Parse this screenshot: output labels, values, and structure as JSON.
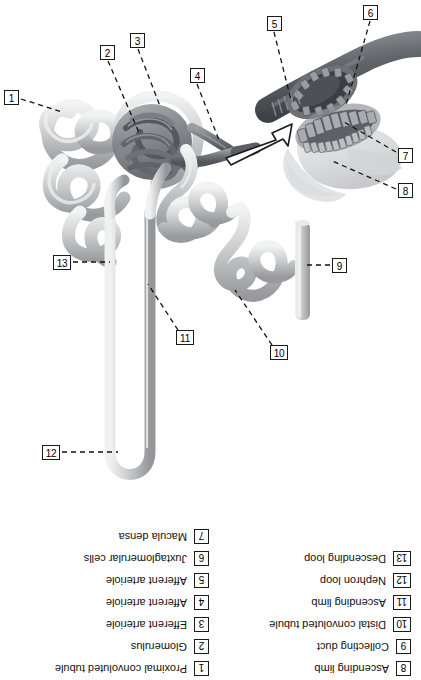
{
  "figure": {
    "colors": {
      "tubule_light": "#d8d9da",
      "tubule_mid": "#b9bbbd",
      "tubule_dark": "#8d9093",
      "glomerulus": "#6f7276",
      "arteriole": "#5d6064",
      "inset_vessel": "#55585c",
      "inset_cells": "#7c7f83",
      "capsule_wash": "#cfd1d3",
      "line": "#1a1a1a",
      "background": "#ffffff"
    }
  },
  "callouts": [
    {
      "id": "1",
      "number": "1",
      "x": 4,
      "y": 90,
      "target_x": 62,
      "target_y": 112
    },
    {
      "id": "2",
      "number": "2",
      "x": 100,
      "y": 45,
      "target_x": 140,
      "target_y": 135
    },
    {
      "id": "3",
      "number": "3",
      "x": 130,
      "y": 33,
      "target_x": 160,
      "target_y": 106
    },
    {
      "id": "4",
      "number": "4",
      "x": 190,
      "y": 68,
      "target_x": 218,
      "target_y": 139
    },
    {
      "id": "5",
      "number": "5",
      "x": 267,
      "y": 16,
      "target_x": 290,
      "target_y": 97
    },
    {
      "id": "6",
      "number": "6",
      "x": 363,
      "y": 5,
      "target_x": 345,
      "target_y": 102
    },
    {
      "id": "7",
      "number": "7",
      "x": 398,
      "y": 148,
      "target_x": 345,
      "target_y": 117
    },
    {
      "id": "8",
      "number": "8",
      "x": 398,
      "y": 183,
      "target_x": 330,
      "target_y": 158
    },
    {
      "id": "9",
      "number": "9",
      "x": 332,
      "y": 258,
      "target_x": 300,
      "target_y": 262
    },
    {
      "id": "10",
      "number": "10",
      "x": 270,
      "y": 345,
      "target_x": 233,
      "target_y": 285
    },
    {
      "id": "11",
      "number": "11",
      "x": 176,
      "y": 330,
      "target_x": 147,
      "target_y": 283
    },
    {
      "id": "12",
      "number": "12",
      "x": 42,
      "y": 445,
      "target_x": 118,
      "target_y": 451
    },
    {
      "id": "13",
      "number": "13",
      "x": 53,
      "y": 255,
      "target_x": 110,
      "target_y": 262
    }
  ],
  "legend": {
    "left_column": [
      {
        "number": "8",
        "label": "Ascending limb"
      },
      {
        "number": "9",
        "label": "Collecting duct"
      },
      {
        "number": "10",
        "label": "Distal convoluted tubule"
      },
      {
        "number": "11",
        "label": "Ascending limb"
      },
      {
        "number": "12",
        "label": "Nephron loop"
      },
      {
        "number": "13",
        "label": "Descending loop"
      }
    ],
    "right_column": [
      {
        "number": "1",
        "label": "Proximal convoluted tubule"
      },
      {
        "number": "2",
        "label": "Glomerulus"
      },
      {
        "number": "3",
        "label": "Efferent arteriole"
      },
      {
        "number": "4",
        "label": "Afferent arteriole"
      },
      {
        "number": "5",
        "label": "Afferent arteriole"
      },
      {
        "number": "6",
        "label": "Juxtaglomerular cells"
      },
      {
        "number": "7",
        "label": "Macula densa"
      }
    ]
  }
}
